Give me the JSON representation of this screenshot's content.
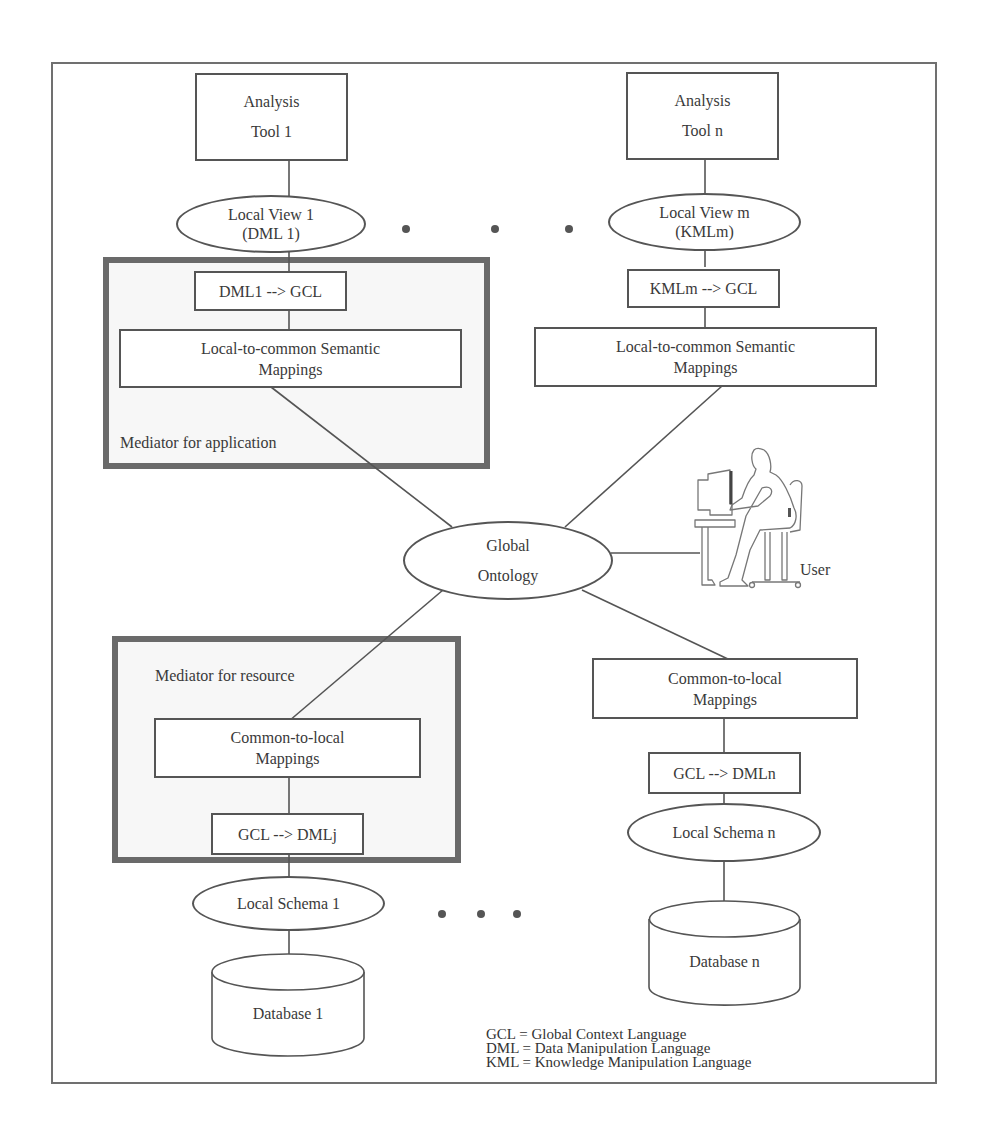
{
  "diagram": {
    "analysis_tools": [
      {
        "line1": "Analysis",
        "line2": "Tool 1"
      },
      {
        "line1": "Analysis",
        "line2": "Tool n"
      }
    ],
    "local_views": [
      {
        "line1": "Local View 1",
        "line2": "(DML 1)"
      },
      {
        "line1": "Local View m",
        "line2": "(KMLm)"
      }
    ],
    "translators_top": [
      "DML1 --> GCL",
      "KMLm --> GCL"
    ],
    "local_to_common": {
      "line1": "Local-to-common Semantic",
      "line2": "Mappings"
    },
    "mediator_application_label": "Mediator for application",
    "mediator_resource_label": "Mediator for resource",
    "global_ontology": {
      "line1": "Global",
      "line2": "Ontology"
    },
    "user_label": "User",
    "common_to_local": {
      "line1": "Common-to-local",
      "line2": "Mappings"
    },
    "translators_bottom": [
      "GCL --> DMLj",
      "GCL --> DMLn"
    ],
    "local_schemas": [
      "Local Schema 1",
      "Local Schema n"
    ],
    "databases": [
      "Database 1",
      "Database n"
    ],
    "legend": [
      "GCL = Global Context Language",
      "DML = Data Manipulation Language",
      "KML = Knowledge Manipulation Language"
    ],
    "colors": {
      "stroke": "#555555",
      "mediator_border": "#6a6a6a",
      "mediator_fill": "#f7f7f7"
    }
  }
}
